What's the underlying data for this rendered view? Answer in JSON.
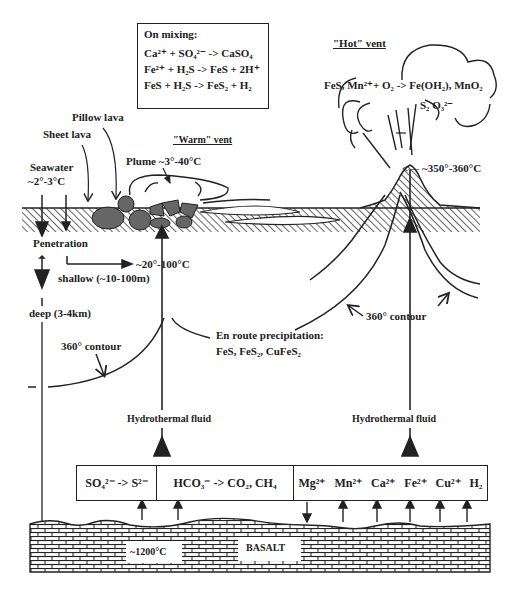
{
  "mixing_box": {
    "title": "On mixing:",
    "equations": [
      {
        "lhs": "Ca²⁺ + SO₄²⁻",
        "arrow": "->",
        "rhs": "CaSO₄"
      },
      {
        "lhs": "Fe²⁺ + H₂S",
        "arrow": "->",
        "rhs": "FeS + 2H⁺"
      },
      {
        "lhs": "FeS + H₂S",
        "arrow": "->",
        "rhs": "FeS₂ + H₂"
      }
    ]
  },
  "hot_vent": {
    "title": "\"Hot\" vent",
    "plume_reaction": "FeS, Mn²⁺+ O₂ -> Fe(OH₂), MnO₂",
    "plume_species": "S₂ O₃²⁻",
    "temperature": "<— ~350°-360°C"
  },
  "warm_vent": {
    "title": "\"Warm\" vent",
    "plume": "Plume ~3°-40°C"
  },
  "labels": {
    "pillow_lava": "Pillow lava",
    "sheet_lava": "Sheet lava",
    "seawater": "Seawater",
    "seawater_temp": "~2°-3°C",
    "penetration": "Penetration",
    "shallow_temp": "~20°-100°C",
    "shallow": "shallow (~10-100m)",
    "deep": "deep (3-4km)",
    "contour_left": "360° contour",
    "contour_right": "360° contour",
    "en_route_title": "En route precipitation:",
    "en_route_minerals": "FeS, FeS₂, CuFeS₂",
    "hydrothermal_fluid_left": "Hydrothermal fluid",
    "hydrothermal_fluid_right": "Hydrothermal fluid",
    "magma_temp": "~1200°C",
    "basalt": "BASALT"
  },
  "reaction_box": {
    "cells": [
      {
        "text": "SO₄²⁻ -> S²⁻"
      },
      {
        "text": "HCO₃⁻ ->  CO₂, CH₄"
      }
    ],
    "ions": [
      "Mg²⁺",
      "Mn²⁺",
      "Ca²⁺",
      "Fe²⁺",
      "Cu²⁺",
      "H₂"
    ]
  },
  "colors": {
    "ink": "#222222",
    "rock_fill": "#666666",
    "background": "#ffffff"
  }
}
